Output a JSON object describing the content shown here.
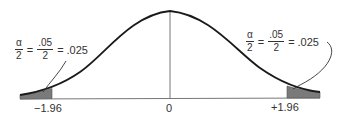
{
  "figure": {
    "type": "standard-normal-two-tailed",
    "colors": {
      "curve": "#1a1a1a",
      "axis": "#777777",
      "tail_fill": "#7a7a7a",
      "text": "#333333"
    }
  },
  "axis_labels": {
    "left_critical": "−1.96",
    "center": "0",
    "right_critical": "+1.96"
  },
  "left_annotation": {
    "alpha_num": "α",
    "alpha_den": "2",
    "eq1": "=",
    "value_num": ".05",
    "value_den": "2",
    "eq2": "=",
    "result": ".025"
  },
  "right_annotation": {
    "alpha_num": "α",
    "alpha_den": "2",
    "eq1": "=",
    "value_num": ".05",
    "value_den": "2",
    "eq2": "=",
    "result": ".025"
  }
}
